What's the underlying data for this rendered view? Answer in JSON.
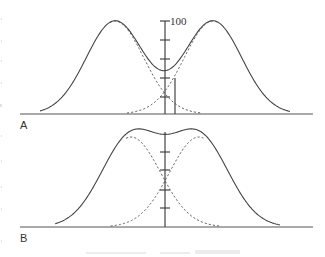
{
  "figure": {
    "colors": {
      "line": "#444444",
      "dashed": "#555555",
      "background": "#ffffff"
    },
    "panels": [
      {
        "label": "A",
        "axis_top_label": "100",
        "baseline_y": 114,
        "axis_x": 165,
        "axis_top_y": 21,
        "ticks_y": [
          21,
          40,
          59,
          78,
          97
        ],
        "marker_line": {
          "x": 175,
          "y_top": 78,
          "y_bottom": 114
        },
        "baseline_x": [
          20,
          313
        ],
        "components": [
          {
            "center": 115,
            "amplitude": 93,
            "sigma": 28.7
          },
          {
            "center": 213,
            "amplitude": 93,
            "sigma": 28.7
          }
        ],
        "curve_range": [
          40,
          290
        ]
      },
      {
        "label": "B",
        "baseline_y": 227,
        "axis_x": 165,
        "axis_top_y": 132,
        "ticks_y": [
          152,
          170,
          190,
          208
        ],
        "baseline_x": [
          20,
          313
        ],
        "components": [
          {
            "center": 131,
            "amplitude": 90,
            "sigma": 29.5
          },
          {
            "center": 199,
            "amplitude": 90,
            "sigma": 29.5
          }
        ],
        "curve_range": [
          55,
          280
        ]
      }
    ]
  }
}
